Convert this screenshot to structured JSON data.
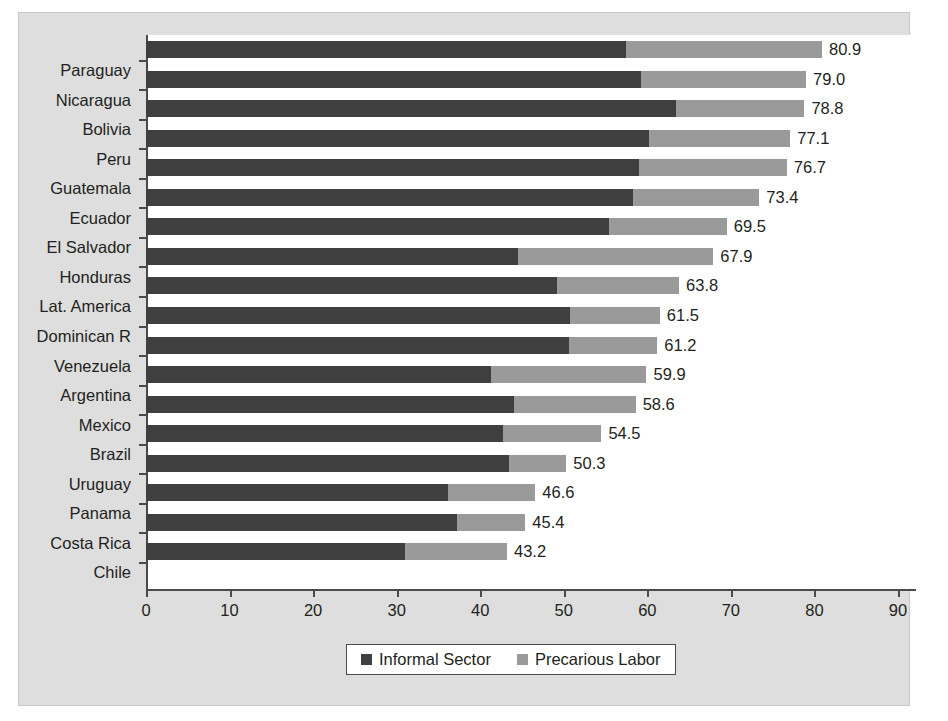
{
  "chart_data": {
    "type": "bar",
    "orientation": "horizontal",
    "stacked": true,
    "title": "",
    "xlabel": "",
    "ylabel": "",
    "xlim": [
      0,
      90
    ],
    "xticks": [
      0,
      10,
      20,
      30,
      40,
      50,
      60,
      70,
      80,
      90
    ],
    "grid": false,
    "legend_position": "bottom",
    "categories": [
      "Paraguay",
      "Nicaragua",
      "Bolivia",
      "Peru",
      "Guatemala",
      "Ecuador",
      "El Salvador",
      "Honduras",
      "Lat. America",
      "Dominican R",
      "Venezuela",
      "Argentina",
      "Mexico",
      "Brazil",
      "Uruguay",
      "Panama",
      "Costa Rica",
      "Chile"
    ],
    "series": [
      {
        "name": "Informal Sector",
        "color": "#3f3f3f",
        "values": [
          57.4,
          59.3,
          63.4,
          60.2,
          59.0,
          58.3,
          55.4,
          44.5,
          49.2,
          50.8,
          50.6,
          41.3,
          44.0,
          42.7,
          43.4,
          36.2,
          37.2,
          31.0
        ]
      },
      {
        "name": "Precarious Labor",
        "color": "#9a9a9a",
        "values": [
          23.5,
          19.7,
          15.4,
          16.9,
          17.7,
          15.1,
          14.1,
          23.4,
          14.6,
          10.7,
          10.6,
          18.6,
          14.6,
          11.8,
          6.9,
          10.4,
          8.2,
          12.2
        ]
      }
    ],
    "totals": [
      80.9,
      79.0,
      78.8,
      77.1,
      76.7,
      73.4,
      69.5,
      67.9,
      63.8,
      61.5,
      61.2,
      59.9,
      58.6,
      54.5,
      50.3,
      46.6,
      45.4,
      43.2
    ],
    "total_labels": [
      "80.9",
      "79.0",
      "78.8",
      "77.1",
      "76.7",
      "73.4",
      "69.5",
      "67.9",
      "63.8",
      "61.5",
      "61.2",
      "59.9",
      "58.6",
      "54.5",
      "50.3",
      "46.6",
      "45.4",
      "43.2"
    ],
    "xtick_labels": [
      "0",
      "10",
      "20",
      "30",
      "40",
      "50",
      "60",
      "70",
      "80",
      "90"
    ],
    "legend": [
      {
        "label": "Informal Sector",
        "color": "#3f3f3f",
        "icon": "square-swatch-icon"
      },
      {
        "label": "Precarious Labor",
        "color": "#9a9a9a",
        "icon": "square-swatch-icon"
      }
    ]
  },
  "style": {
    "frame_background": "#dedede",
    "plot_background": "#ffffff",
    "axis_color": "#4a4a4a",
    "text_color": "#231f20"
  }
}
